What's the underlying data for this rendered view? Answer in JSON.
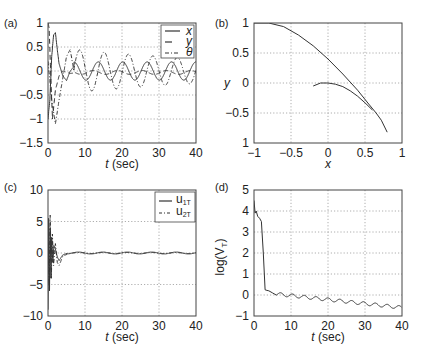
{
  "chart_data": [
    {
      "id": "a",
      "panel_label": "(a)",
      "type": "line",
      "xlabel_italic": "t",
      "xlabel_rest": " (sec)",
      "ylabel": "",
      "xlim": [
        0,
        40
      ],
      "ylim": [
        -1.5,
        1
      ],
      "xticks": [
        0,
        10,
        20,
        30,
        40
      ],
      "xtick_labels": [
        "0",
        "10",
        "20",
        "30",
        "40"
      ],
      "yticks": [
        -1.5,
        -1,
        -0.5,
        0,
        0.5,
        1
      ],
      "ytick_labels": [
        "−1.5",
        "−1",
        "−0.5",
        "0",
        "0.5",
        "1"
      ],
      "grid": true,
      "legend": {
        "position": "upper right",
        "entries": [
          {
            "label": "x",
            "style": "solid"
          },
          {
            "label": "y",
            "style": "dashed"
          },
          {
            "label": "θ",
            "style": "dashdot"
          }
        ]
      },
      "series": [
        {
          "name": "x",
          "style": "solid",
          "description": "transient up to ~0.8 at t~2, then steady oscillation amplitude ~0.18, period ~6.5",
          "x": [
            0,
            0.5,
            1,
            1.5,
            2,
            2.5,
            3,
            4,
            5,
            6,
            8,
            10,
            13,
            16,
            20,
            25,
            30,
            35,
            40
          ],
          "y": [
            -1.0,
            -0.6,
            0.3,
            0.75,
            0.8,
            0.45,
            0.15,
            -0.1,
            -0.2,
            0.0,
            0.18,
            -0.18,
            0.18,
            -0.18,
            0.18,
            -0.18,
            0.18,
            -0.18,
            0.1
          ]
        },
        {
          "name": "y",
          "style": "dashed",
          "description": "starts at 1, drops to -1 quickly, then small oscillation ~0.05 around -0.03",
          "x": [
            0,
            0.3,
            0.8,
            1.2,
            2,
            3,
            4,
            6,
            10,
            20,
            30,
            40
          ],
          "y": [
            1.0,
            0.9,
            -0.2,
            -1.0,
            -0.4,
            -0.1,
            0.0,
            -0.05,
            -0.02,
            -0.05,
            -0.02,
            -0.05
          ]
        },
        {
          "name": "theta",
          "style": "dashdot",
          "description": "dips to ~-1.1 at t~2, then oscillation amplitude ~0.45 decaying to ~0.3, period ~6.5",
          "x": [
            0,
            1,
            2,
            3,
            5,
            6,
            8,
            10,
            13,
            16,
            20,
            25,
            30,
            35,
            40
          ],
          "y": [
            0.2,
            -0.6,
            -1.1,
            -0.6,
            0.3,
            0.45,
            -0.45,
            0.0,
            0.4,
            -0.4,
            0.35,
            -0.3,
            0.3,
            -0.3,
            0.25
          ]
        }
      ]
    },
    {
      "id": "b",
      "panel_label": "(b)",
      "type": "line",
      "xlabel_italic": "x",
      "xlabel_rest": "",
      "ylabel": "y",
      "xlim": [
        -1,
        1
      ],
      "ylim": [
        -1,
        1
      ],
      "xticks": [
        -1,
        -0.5,
        0,
        0.5,
        1
      ],
      "xtick_labels": [
        "−1",
        "−0.5",
        "0",
        "0.5",
        "1"
      ],
      "yticks": [
        -1,
        -0.5,
        0,
        0.5,
        1
      ],
      "ytick_labels": [
        "1",
        "−0.5",
        "0",
        "0.5",
        "1"
      ],
      "grid": true,
      "series": [
        {
          "name": "trajectory",
          "style": "solid",
          "description": "x-y path of the vehicle",
          "x": [
            -1.0,
            -0.8,
            -0.6,
            -0.4,
            -0.2,
            0.0,
            0.2,
            0.4,
            0.55,
            0.65,
            0.72,
            0.8
          ],
          "y": [
            1.0,
            1.0,
            0.94,
            0.8,
            0.62,
            0.4,
            0.15,
            -0.12,
            -0.35,
            -0.5,
            -0.62,
            -0.82
          ]
        },
        {
          "name": "trajectory-branch",
          "style": "solid",
          "x": [
            -0.2,
            -0.1,
            0.0,
            0.1,
            0.2,
            0.3,
            0.4,
            0.5,
            0.6
          ],
          "y": [
            -0.05,
            0.0,
            0.0,
            -0.02,
            -0.06,
            -0.13,
            -0.22,
            -0.33,
            -0.45
          ]
        }
      ]
    },
    {
      "id": "c",
      "panel_label": "(c)",
      "type": "line",
      "xlabel_italic": "t",
      "xlabel_rest": " (sec)",
      "ylabel": "",
      "xlim": [
        0,
        40
      ],
      "ylim": [
        -10,
        10
      ],
      "xticks": [
        0,
        10,
        20,
        30,
        40
      ],
      "xtick_labels": [
        "0",
        "10",
        "20",
        "30",
        "40"
      ],
      "yticks": [
        -10,
        -5,
        0,
        5,
        10
      ],
      "ytick_labels": [
        "−10",
        "−5",
        "0",
        "5",
        "10"
      ],
      "grid": true,
      "legend": {
        "position": "upper right",
        "entries": [
          {
            "label": "u",
            "sub": "1T",
            "style": "solid"
          },
          {
            "label": "u",
            "sub": "2T",
            "style": "dashdot"
          }
        ]
      },
      "series": [
        {
          "name": "u1T",
          "style": "solid",
          "x": [
            0,
            0.2,
            0.4,
            0.6,
            0.8,
            1.0,
            1.3,
            1.6,
            2.0,
            2.5,
            3,
            4,
            6,
            8,
            12,
            16,
            20,
            25,
            30,
            35,
            40
          ],
          "y": [
            -9,
            5.5,
            -6,
            4,
            -4,
            2.5,
            -1.5,
            1.2,
            0.6,
            -0.6,
            -1.2,
            -0.3,
            0.1,
            0.2,
            -0.15,
            0.15,
            0.2,
            -0.15,
            0.1,
            -0.1,
            0.1
          ]
        },
        {
          "name": "u2T",
          "style": "dashdot",
          "x": [
            0,
            0.3,
            0.6,
            0.9,
            1.2,
            1.5,
            2.0,
            2.5,
            3,
            4,
            6,
            10,
            20,
            30,
            40
          ],
          "y": [
            3,
            -5,
            6,
            -4,
            3,
            -2,
            1.5,
            -1.5,
            -2,
            -0.5,
            0.0,
            0.0,
            0.1,
            0.0,
            0.1
          ]
        }
      ]
    },
    {
      "id": "d",
      "panel_label": "(d)",
      "type": "line",
      "xlabel_italic": "t",
      "xlabel_rest": " (sec)",
      "ylabel": "log(V",
      "ylabel_sub": "T",
      "ylabel_end": ")",
      "xlim": [
        0,
        40
      ],
      "ylim": [
        -1,
        5
      ],
      "xticks": [
        0,
        10,
        20,
        30,
        40
      ],
      "xtick_labels": [
        "0",
        "10",
        "20",
        "30",
        "40"
      ],
      "yticks": [
        -1,
        0,
        1,
        2,
        3,
        4,
        5
      ],
      "ytick_labels": [
        "−1",
        "0",
        "1",
        "2",
        "3",
        "4",
        "5"
      ],
      "grid": true,
      "series": [
        {
          "name": "logVT",
          "style": "solid",
          "description": "starts ~4.5, plateau ~3.8 until t~2, sharp drop to ~0.2 at t~3, then slow decline with ripple to ~-0.7 at t=40",
          "x": [
            0,
            0.3,
            0.6,
            1,
            1.5,
            2.0,
            2.5,
            3.0,
            3.5,
            4,
            5,
            6
          ],
          "y": [
            4.5,
            3.9,
            4.0,
            3.75,
            3.65,
            3.5,
            2.0,
            0.25,
            0.22,
            0.2,
            0.1,
            0.0
          ],
          "tail": {
            "from_t": 6,
            "to_t": 40,
            "start": 0.05,
            "end": -0.6,
            "ripple_amp": 0.08,
            "ripple_period": 3.2
          }
        }
      ]
    }
  ]
}
